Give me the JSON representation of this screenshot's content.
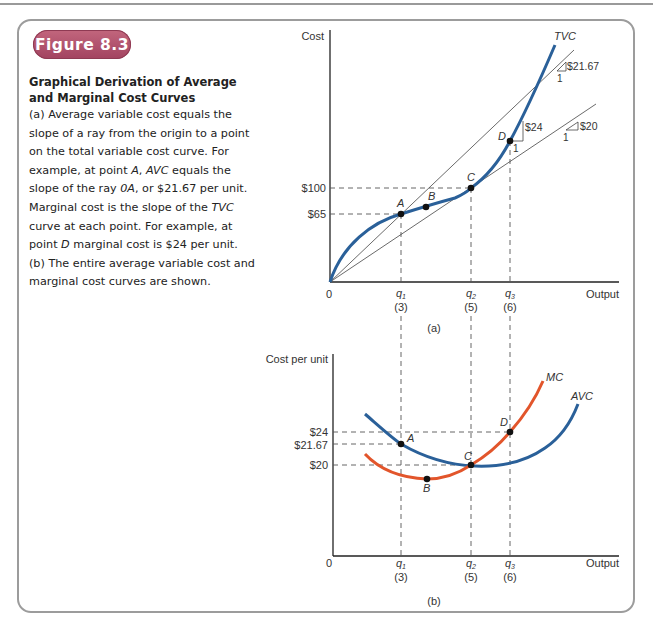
{
  "figure": {
    "badge": "Figure 8.3",
    "title_line1": "Graphical Derivation of Average",
    "title_line2": "and Marginal Cost Curves",
    "caption_parts": [
      {
        "t": "(a) Average variable cost equals the slope of a ray from the origin to a point on the total variable cost curve. For example, at point "
      },
      {
        "t": "A",
        "i": true
      },
      {
        "t": ", "
      },
      {
        "t": "AVC",
        "i": true
      },
      {
        "t": " equals the slope of the ray "
      },
      {
        "t": "0A",
        "i": true
      },
      {
        "t": ", or $21.67 per unit. Marginal cost is the slope of the "
      },
      {
        "t": "TVC",
        "i": true
      },
      {
        "t": " curve at each point. For example, at point "
      },
      {
        "t": "D",
        "i": true
      },
      {
        "t": " marginal cost is $24 per unit. (b) The entire average variable cost and marginal cost curves are shown."
      }
    ]
  },
  "colors": {
    "badge": "#a94d67",
    "avc_tvc_blue": "#2a6099",
    "mc_orange": "#e2552b",
    "frame": "#9c9c9c"
  },
  "chart_data": [
    {
      "type": "line",
      "panel_label": "(a)",
      "ylabel": "Cost",
      "xlabel": "Output",
      "origin_label": "0",
      "x_ticks": [
        {
          "q": "q1",
          "sub": "1",
          "value": "(3)",
          "x": 3
        },
        {
          "q": "q2",
          "sub": "2",
          "value": "(5)",
          "x": 5
        },
        {
          "q": "q3",
          "sub": "3",
          "value": "(6)",
          "x": 6
        }
      ],
      "y_ticks": [
        {
          "label": "$65",
          "y": 65
        },
        {
          "label": "$100",
          "y": 100
        }
      ],
      "series": [
        {
          "name": "TVC",
          "color": "#2a6099",
          "points": [
            [
              0,
              0
            ],
            [
              3,
              65
            ],
            [
              4,
              80
            ],
            [
              5,
              100
            ],
            [
              6,
              144
            ]
          ]
        },
        {
          "name": "Ray 0A (slope $21.67)",
          "color": "#555",
          "slope": 21.67
        },
        {
          "name": "Ray 0C (slope $20)",
          "color": "#555",
          "slope": 20
        }
      ],
      "points": [
        {
          "label": "A",
          "x": 3,
          "y": 65
        },
        {
          "label": "B",
          "x": 4,
          "y": 80
        },
        {
          "label": "C",
          "x": 5,
          "y": 100
        },
        {
          "label": "D",
          "x": 6,
          "y": 144
        }
      ],
      "slope_annotations": [
        {
          "rise": "$21.67",
          "run": "1"
        },
        {
          "rise": "$24",
          "run": "1"
        },
        {
          "rise": "$20",
          "run": "1"
        }
      ],
      "curve_label": "TVC"
    },
    {
      "type": "line",
      "panel_label": "(b)",
      "ylabel": "Cost per unit",
      "xlabel": "Output",
      "origin_label": "0",
      "x_ticks": [
        {
          "q": "q1",
          "sub": "1",
          "value": "(3)",
          "x": 3
        },
        {
          "q": "q2",
          "sub": "2",
          "value": "(5)",
          "x": 5
        },
        {
          "q": "q3",
          "sub": "3",
          "value": "(6)",
          "x": 6
        }
      ],
      "y_ticks": [
        {
          "label": "$24",
          "y": 24
        },
        {
          "label": "$21.67",
          "y": 21.67
        },
        {
          "label": "$20",
          "y": 20
        }
      ],
      "series": [
        {
          "name": "MC",
          "color": "#e2552b",
          "points": [
            [
              4,
              18.8
            ],
            [
              5,
              20
            ],
            [
              6,
              24
            ]
          ]
        },
        {
          "name": "AVC",
          "color": "#2a6099",
          "points": [
            [
              3,
              21.67
            ],
            [
              5,
              20
            ],
            [
              6,
              20.5
            ]
          ]
        }
      ],
      "points": [
        {
          "label": "A",
          "x": 3,
          "y": 21.67
        },
        {
          "label": "B",
          "x": 4,
          "y": 18.8
        },
        {
          "label": "C",
          "x": 5,
          "y": 20
        },
        {
          "label": "D",
          "x": 6,
          "y": 24
        }
      ]
    }
  ]
}
